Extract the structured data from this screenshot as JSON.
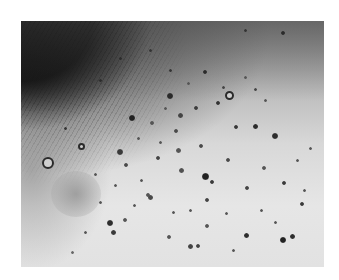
{
  "image": {
    "description": "Grayscale clinical photograph of a chest region densely covered with numerous small dark round lesions (nodules/papules), with a nipple on the left side and hair/shadow in the upper-left corner",
    "frame": {
      "x": 21,
      "y": 21,
      "width": 303,
      "height": 246
    },
    "background_color": "#ffffff",
    "colors": {
      "skin_light": "#e2e2e2",
      "skin_mid": "#b8b8b8",
      "shadow": "#050505",
      "spot": "#3a3a3a"
    },
    "rings": [
      {
        "x": 48,
        "y": 163,
        "d": 12
      },
      {
        "x": 229,
        "y": 95,
        "d": 9
      },
      {
        "x": 81,
        "y": 146,
        "d": 7
      }
    ],
    "spots": [
      {
        "x": 170,
        "y": 96,
        "d": 6,
        "c": "#2a2a2a"
      },
      {
        "x": 180,
        "y": 115,
        "d": 5,
        "c": "#444"
      },
      {
        "x": 132,
        "y": 118,
        "d": 6,
        "c": "#222"
      },
      {
        "x": 152,
        "y": 123,
        "d": 4,
        "c": "#555"
      },
      {
        "x": 176,
        "y": 131,
        "d": 4,
        "c": "#4a4a4a"
      },
      {
        "x": 196,
        "y": 108,
        "d": 4,
        "c": "#3c3c3c"
      },
      {
        "x": 218,
        "y": 103,
        "d": 4,
        "c": "#333"
      },
      {
        "x": 255,
        "y": 126,
        "d": 5,
        "c": "#2b2b2b"
      },
      {
        "x": 236,
        "y": 127,
        "d": 4,
        "c": "#383838"
      },
      {
        "x": 275,
        "y": 136,
        "d": 6,
        "c": "#2e2e2e"
      },
      {
        "x": 201,
        "y": 146,
        "d": 4,
        "c": "#4a4a4a"
      },
      {
        "x": 178,
        "y": 150,
        "d": 5,
        "c": "#555"
      },
      {
        "x": 158,
        "y": 158,
        "d": 4,
        "c": "#444"
      },
      {
        "x": 181,
        "y": 170,
        "d": 5,
        "c": "#505050"
      },
      {
        "x": 205,
        "y": 176,
        "d": 7,
        "c": "#222"
      },
      {
        "x": 212,
        "y": 182,
        "d": 4,
        "c": "#3a3a3a"
      },
      {
        "x": 228,
        "y": 160,
        "d": 4,
        "c": "#4a4a4a"
      },
      {
        "x": 247,
        "y": 188,
        "d": 4,
        "c": "#444"
      },
      {
        "x": 284,
        "y": 183,
        "d": 4,
        "c": "#3a3a3a"
      },
      {
        "x": 120,
        "y": 152,
        "d": 6,
        "c": "#3a3a3a"
      },
      {
        "x": 126,
        "y": 165,
        "d": 4,
        "c": "#4a4a4a"
      },
      {
        "x": 110,
        "y": 223,
        "d": 6,
        "c": "#2e2e2e"
      },
      {
        "x": 113,
        "y": 232,
        "d": 5,
        "c": "#3a3a3a"
      },
      {
        "x": 125,
        "y": 220,
        "d": 4,
        "c": "#555"
      },
      {
        "x": 148,
        "y": 195,
        "d": 4,
        "c": "#555"
      },
      {
        "x": 150,
        "y": 197,
        "d": 5,
        "c": "#4a4a4a"
      },
      {
        "x": 207,
        "y": 200,
        "d": 4,
        "c": "#444"
      },
      {
        "x": 246,
        "y": 235,
        "d": 5,
        "c": "#2e2e2e"
      },
      {
        "x": 283,
        "y": 240,
        "d": 6,
        "c": "#222"
      },
      {
        "x": 292,
        "y": 236,
        "d": 5,
        "c": "#2e2e2e"
      },
      {
        "x": 190,
        "y": 246,
        "d": 5,
        "c": "#444"
      },
      {
        "x": 198,
        "y": 246,
        "d": 4,
        "c": "#444"
      },
      {
        "x": 207,
        "y": 226,
        "d": 4,
        "c": "#555"
      },
      {
        "x": 169,
        "y": 237,
        "d": 4,
        "c": "#555"
      },
      {
        "x": 302,
        "y": 204,
        "d": 4,
        "c": "#3a3a3a"
      },
      {
        "x": 264,
        "y": 168,
        "d": 4,
        "c": "#555"
      },
      {
        "x": 304,
        "y": 190,
        "d": 3,
        "c": "#555"
      },
      {
        "x": 205,
        "y": 72,
        "d": 4,
        "c": "#2b2b2b"
      },
      {
        "x": 283,
        "y": 33,
        "d": 4,
        "c": "#2b2b2b"
      },
      {
        "x": 138,
        "y": 138,
        "d": 3,
        "c": "#555"
      },
      {
        "x": 141,
        "y": 180,
        "d": 3,
        "c": "#555"
      },
      {
        "x": 95,
        "y": 174,
        "d": 3,
        "c": "#555"
      },
      {
        "x": 85,
        "y": 232,
        "d": 3,
        "c": "#555"
      },
      {
        "x": 72,
        "y": 252,
        "d": 3,
        "c": "#666"
      },
      {
        "x": 233,
        "y": 250,
        "d": 3,
        "c": "#555"
      },
      {
        "x": 261,
        "y": 210,
        "d": 3,
        "c": "#555"
      },
      {
        "x": 223,
        "y": 87,
        "d": 3,
        "c": "#444"
      },
      {
        "x": 255,
        "y": 89,
        "d": 3,
        "c": "#444"
      },
      {
        "x": 265,
        "y": 100,
        "d": 3,
        "c": "#555"
      },
      {
        "x": 245,
        "y": 77,
        "d": 3,
        "c": "#555"
      },
      {
        "x": 188,
        "y": 83,
        "d": 3,
        "c": "#555"
      },
      {
        "x": 165,
        "y": 108,
        "d": 3,
        "c": "#555"
      },
      {
        "x": 160,
        "y": 142,
        "d": 3,
        "c": "#555"
      },
      {
        "x": 115,
        "y": 185,
        "d": 3,
        "c": "#555"
      },
      {
        "x": 100,
        "y": 202,
        "d": 3,
        "c": "#555"
      },
      {
        "x": 134,
        "y": 205,
        "d": 3,
        "c": "#555"
      },
      {
        "x": 173,
        "y": 212,
        "d": 3,
        "c": "#555"
      },
      {
        "x": 190,
        "y": 210,
        "d": 3,
        "c": "#555"
      },
      {
        "x": 226,
        "y": 213,
        "d": 3,
        "c": "#555"
      },
      {
        "x": 275,
        "y": 222,
        "d": 3,
        "c": "#555"
      },
      {
        "x": 297,
        "y": 160,
        "d": 3,
        "c": "#555"
      },
      {
        "x": 310,
        "y": 148,
        "d": 3,
        "c": "#555"
      },
      {
        "x": 120,
        "y": 58,
        "d": 3,
        "c": "#2b2b2b"
      },
      {
        "x": 150,
        "y": 50,
        "d": 3,
        "c": "#333"
      },
      {
        "x": 170,
        "y": 70,
        "d": 3,
        "c": "#333"
      },
      {
        "x": 100,
        "y": 80,
        "d": 3,
        "c": "#2b2b2b"
      },
      {
        "x": 65,
        "y": 128,
        "d": 3,
        "c": "#333"
      },
      {
        "x": 245,
        "y": 30,
        "d": 3,
        "c": "#333"
      }
    ]
  }
}
